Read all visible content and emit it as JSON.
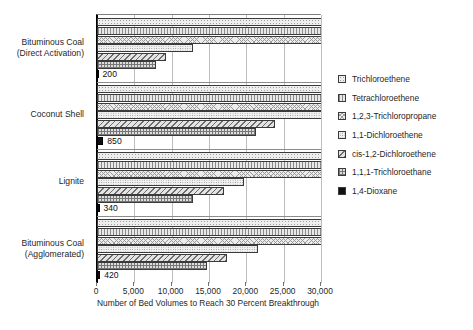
{
  "chart_data": {
    "type": "bar",
    "orientation": "horizontal",
    "title": "",
    "xlabel": "Number of Bed Volumes to Reach 30 Percent Breakthrough",
    "ylabel": "",
    "xlim": [
      0,
      30000
    ],
    "xticks": [
      "0",
      "5,000",
      "10,000",
      "15,000",
      "20,000",
      "25,000",
      "30,000"
    ],
    "xtick_values": [
      0,
      5000,
      10000,
      15000,
      20000,
      25000,
      30000
    ],
    "grid": true,
    "legend_position": "right",
    "categories": [
      "Bituminous Coal (Direct Activation)",
      "Coconut Shell",
      "Lignite",
      "Bituminous Coal (Agglomerated)"
    ],
    "category_lines": [
      [
        "Bituminous Coal",
        "(Direct Activation)"
      ],
      [
        "Coconut Shell"
      ],
      [
        "Lignite"
      ],
      [
        "Bituminous Coal",
        "(Agglomerated)"
      ]
    ],
    "series": [
      {
        "name": "Trichloroethene",
        "pattern": "p-tce",
        "values": [
          30000,
          30000,
          30000,
          30000
        ],
        "clipped": [
          true,
          true,
          true,
          true
        ]
      },
      {
        "name": "Tetrachloroethene",
        "pattern": "p-pce",
        "values": [
          30000,
          30000,
          30000,
          30000
        ],
        "clipped": [
          true,
          true,
          true,
          true
        ]
      },
      {
        "name": "1,2,3-Trichloropropane",
        "pattern": "p-tcp",
        "values": [
          30000,
          30000,
          30000,
          30000
        ],
        "clipped": [
          true,
          true,
          true,
          true
        ]
      },
      {
        "name": "1,1-Dichloroethene",
        "pattern": "p-11dce",
        "values": [
          12800,
          30000,
          19700,
          21500
        ],
        "clipped": [
          false,
          true,
          false,
          false
        ]
      },
      {
        "name": "cis-1,2-Dichloroethene",
        "pattern": "p-cisdce",
        "values": [
          9200,
          23800,
          17000,
          17400
        ],
        "clipped": [
          false,
          false,
          false,
          false
        ]
      },
      {
        "name": "1,1,1-Trichloroethane",
        "pattern": "p-tca",
        "values": [
          7900,
          21300,
          12900,
          14700
        ],
        "clipped": [
          false,
          false,
          false,
          false
        ]
      },
      {
        "name": "1,4-Dioxane",
        "pattern": "p-dioxane",
        "values": [
          200,
          850,
          340,
          420
        ],
        "clipped": [
          false,
          false,
          false,
          false
        ],
        "data_labels": [
          "200",
          "850",
          "340",
          "420"
        ]
      }
    ]
  },
  "legend": {
    "items": [
      {
        "label": "Trichloroethene",
        "pattern": "p-tce"
      },
      {
        "label": "Tetrachloroethene",
        "pattern": "p-pce"
      },
      {
        "label": "1,2,3-Trichloropropane",
        "pattern": "p-tcp"
      },
      {
        "label": "1,1-Dichloroethene",
        "pattern": "p-11dce"
      },
      {
        "label": "cis-1,2-Dichloroethene",
        "pattern": "p-cisdce"
      },
      {
        "label": "1,1,1-Trichloroethane",
        "pattern": "p-tca"
      },
      {
        "label": "1,4-Dioxane",
        "pattern": "p-dioxane"
      }
    ]
  },
  "colors": {
    "axis": "#000000",
    "grid": "#bdbdbd",
    "text": "#1f1f1f",
    "bar_outline": "#3a3a3a",
    "dioxane_fill": "#111111",
    "background": "#ffffff"
  }
}
